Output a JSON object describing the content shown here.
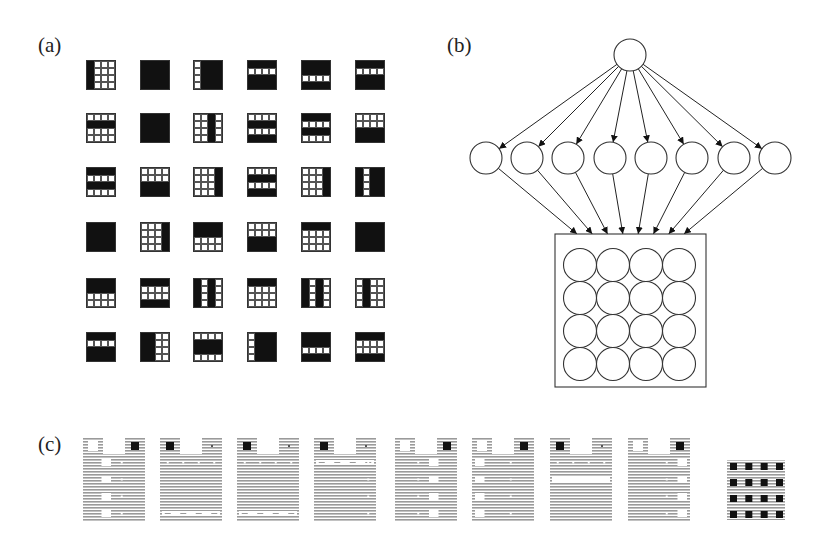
{
  "labels": {
    "a": "(a)",
    "b": "(b)",
    "c": "(c)"
  },
  "panel_a": {
    "description": "6x6 array of 4x4 binary bar patterns",
    "col_x": [
      86,
      140,
      193,
      247,
      301,
      355
    ],
    "row_y": [
      60,
      113,
      167,
      222,
      278,
      332
    ],
    "patterns": [
      [
        {
          "type": "cols",
          "on": [
            0
          ]
        },
        {
          "type": "all"
        },
        {
          "type": "cols",
          "on": [
            1,
            2,
            3
          ]
        },
        {
          "type": "rows",
          "on": [
            0,
            2,
            3
          ]
        },
        {
          "type": "rows",
          "on": [
            0,
            1,
            3
          ]
        },
        {
          "type": "rows",
          "on": [
            0,
            2,
            3
          ]
        }
      ],
      [
        {
          "type": "rows",
          "on": [
            1
          ]
        },
        {
          "type": "all"
        },
        {
          "type": "cols",
          "on": [
            2
          ]
        },
        {
          "type": "rows",
          "on": [
            1,
            3
          ]
        },
        {
          "type": "rows",
          "on": [
            0,
            2
          ]
        },
        {
          "type": "rows",
          "on": [
            2,
            3
          ]
        }
      ],
      [
        {
          "type": "rows",
          "on": [
            0,
            2
          ]
        },
        {
          "type": "rows",
          "on": [
            2,
            3
          ]
        },
        {
          "type": "cols",
          "on": [
            3
          ]
        },
        {
          "type": "rows",
          "on": [
            1,
            3
          ]
        },
        {
          "type": "cols",
          "on": [
            3
          ]
        },
        {
          "type": "cols",
          "on": [
            0,
            2,
            3
          ]
        }
      ],
      [
        {
          "type": "all"
        },
        {
          "type": "cols",
          "on": [
            3
          ]
        },
        {
          "type": "rows",
          "on": [
            0,
            1
          ]
        },
        {
          "type": "rows",
          "on": [
            2,
            3
          ]
        },
        {
          "type": "rows",
          "on": [
            0
          ]
        },
        {
          "type": "all"
        }
      ],
      [
        {
          "type": "rows",
          "on": [
            0,
            1
          ]
        },
        {
          "type": "rows",
          "on": [
            0,
            3
          ]
        },
        {
          "type": "cols",
          "on": [
            0,
            2
          ]
        },
        {
          "type": "rows",
          "on": [
            0
          ]
        },
        {
          "type": "cols",
          "on": [
            0,
            2
          ]
        },
        {
          "type": "cols",
          "on": [
            1
          ]
        }
      ],
      [
        {
          "type": "rows",
          "on": [
            0,
            2,
            3
          ]
        },
        {
          "type": "cols",
          "on": [
            0,
            1
          ]
        },
        {
          "type": "rows",
          "on": [
            1,
            2
          ]
        },
        {
          "type": "cols",
          "on": [
            1,
            2,
            3
          ]
        },
        {
          "type": "rows",
          "on": [
            0,
            1,
            3
          ]
        },
        {
          "type": "rows",
          "on": [
            0,
            3
          ]
        }
      ]
    ]
  },
  "panel_b": {
    "description": "Network: 1 top unit -> 8 hidden units -> 4x4 visible units",
    "top_node": {
      "cx": 630,
      "cy": 55,
      "r": 16
    },
    "hidden_nodes": {
      "cy": 158,
      "r": 16,
      "cx": [
        486,
        527,
        568,
        610,
        651,
        692,
        734,
        775
      ]
    },
    "visible_box": {
      "x": 555,
      "y": 234,
      "w": 151,
      "h": 153
    },
    "visible_grid": {
      "rows": 4,
      "cols": 4,
      "cx0": 580,
      "cy0": 265,
      "dx": 33,
      "dy": 33,
      "r": 16.5
    }
  },
  "panel_c": {
    "description": "Learned weight visualizations for 8 hidden units plus bias",
    "images": [
      {
        "x": 83,
        "tl": "white",
        "tr": "black",
        "cols_white": [
          1
        ],
        "rows_white": [],
        "dots": "col2"
      },
      {
        "x": 160,
        "tl": "black",
        "tr": "dot",
        "cols_white": [],
        "rows_white": [
          3
        ],
        "dots": "row0"
      },
      {
        "x": 237,
        "tl": "black",
        "tr": "dot",
        "cols_white": [],
        "rows_white": [
          3
        ],
        "dots": "row0"
      },
      {
        "x": 314,
        "tl": "black",
        "tr": "dot",
        "cols_white": [],
        "rows_white": [
          0
        ],
        "dots": "col3"
      },
      {
        "x": 395,
        "tl": "white",
        "tr": "black",
        "cols_white": [
          2
        ],
        "rows_white": [],
        "dots": "col1"
      },
      {
        "x": 472,
        "tl": "white",
        "tr": "black",
        "cols_white": [
          0
        ],
        "rows_white": [],
        "dots": "col2"
      },
      {
        "x": 550,
        "tl": "black",
        "tr": "dot",
        "cols_white": [],
        "rows_white": [
          1
        ],
        "dots": "row0"
      },
      {
        "x": 628,
        "tl": "white",
        "tr": "black",
        "cols_white": [
          3
        ],
        "rows_white": [],
        "dots": "col2"
      }
    ],
    "image_y": 438,
    "image_w": 62,
    "image_h": 84,
    "bias_image": {
      "x": 727,
      "y": 460,
      "w": 58,
      "h": 60,
      "rows": 4,
      "cols": 4
    }
  }
}
